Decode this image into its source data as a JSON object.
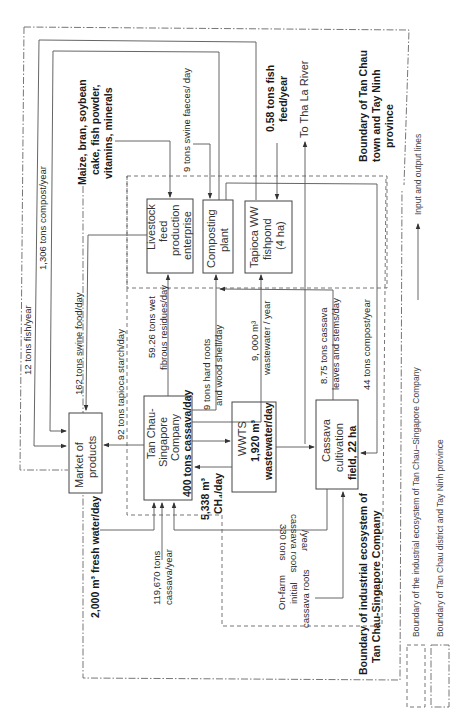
{
  "nodes": {
    "market": {
      "line1": "Market of",
      "line2": "products"
    },
    "livestock": {
      "line1": "Livestock",
      "line2": "feed",
      "line3": "production",
      "line4": "enterprise"
    },
    "composting": {
      "line1": "Composting",
      "line2": "plant"
    },
    "fishpond": {
      "line1": "Tapioca WW",
      "line2": "fishpond",
      "line3": "(4 ha)"
    },
    "company": {
      "line1": "Tan Chau-",
      "line2": "Singapore",
      "line3": "Company",
      "line4": "400 tons cassava/day"
    },
    "wwts": {
      "line1": "WWTS",
      "line2": "1,920 m³",
      "line3": "wastewater/day"
    },
    "cassava_field": {
      "line1": "Cassava",
      "line2": "cultivation",
      "line3": "field, 22 ha"
    }
  },
  "flows": {
    "fish": "12 tons fish/year",
    "compost_market": "1,306 tons compost/year",
    "swine_food": "162 tons swine food/day",
    "tapioca_starch": "92 tons tapioca starch/day",
    "wet_residues_1": "59.26 tons wet",
    "wet_residues_2": "fibrous residues/day",
    "hard_roots_1": "9 tons hard roots",
    "hard_roots_2": "and wood shell/day",
    "wastewater_year_1": "9, 000  m³",
    "wastewater_year_2": "wastewater / year",
    "cassava_leaves_1": "8.75 tons cassava",
    "cassava_leaves_2": "leaves and stems/day",
    "compost_field": "44 tons compost/year",
    "swine_faeces": "9 tons swine faeces/ day",
    "fish_feed_1": "0.58 tons fish",
    "fish_feed_2": "feed/year",
    "river": "To Tha La River",
    "ch4_1": "5,338  m³",
    "ch4_2": "CH₄/day",
    "fresh_water": "2,000 m³ fresh water/day",
    "cassava_year_1": "119,670 tons",
    "cassava_year_2": "cassava/year",
    "cassava_roots_1": "330 tons",
    "cassava_roots_2": "cassava roots",
    "cassava_roots_3": "/year",
    "onfarm_1": "On-farm",
    "onfarm_2": "initial",
    "onfarm_3": "cassava roots"
  },
  "inputs": {
    "feed_ingredients_1": "Maize, bran, soybean",
    "feed_ingredients_2": "cake, fish powder,",
    "feed_ingredients_3": "vitamins, minerals"
  },
  "boundaries": {
    "province_1": "Boundary of Tan Chau",
    "province_2": "town and Tay Ninh",
    "province_3": "province",
    "company_1": "Boundary of industrial ecosystem of",
    "company_2": "Tan Chau-Singapore Company"
  },
  "legend": {
    "io_lines": "Input and output lines",
    "industrial": "Boundary of the industrial ecosystem of Tan Chau–Singapore Company",
    "district": "Boundary of Tan Chau district and Tay Ninh province"
  }
}
